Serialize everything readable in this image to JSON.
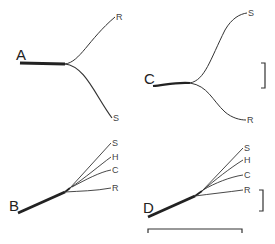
{
  "figure": {
    "panels": [
      {
        "id": "A",
        "label": "A",
        "leaves": [
          "R",
          "S"
        ]
      },
      {
        "id": "B",
        "label": "B",
        "leaves": [
          "S",
          "H",
          "C",
          "R"
        ]
      },
      {
        "id": "C",
        "label": "C",
        "leaves": [
          "S",
          "R"
        ]
      },
      {
        "id": "D",
        "label": "D",
        "leaves": [
          "S",
          "H",
          "C",
          "R"
        ]
      }
    ],
    "scale_bars": {
      "vertical_top": "bracket",
      "vertical_bottom": "bracket",
      "horizontal": "bracket"
    }
  }
}
